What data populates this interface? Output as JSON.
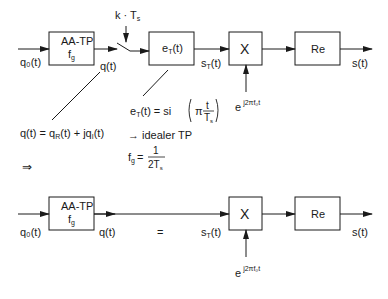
{
  "diagram": {
    "top": {
      "input_label": "q₀(t)",
      "aa_box": {
        "line1": "AA-TP",
        "line2": "f",
        "line2_sub": "g"
      },
      "q_label": "q(t)",
      "sampler_label": "k · T",
      "sampler_sub": "s",
      "eT_box": {
        "main": "e",
        "sub": "T",
        "tail": "(t)"
      },
      "sT_label": {
        "main": "s",
        "sub": "T",
        "tail": "(t)"
      },
      "mult_box": "X",
      "re_box": "Re",
      "output_label": "s(t)",
      "carrier": {
        "base": "e",
        "exp": "j2πf₀t"
      }
    },
    "annotations": {
      "q_decomp": "q(t) = q",
      "q_decomp_R": "R",
      "q_decomp_mid": "(t) + jq",
      "q_decomp_I": "I",
      "q_decomp_end": "(t)",
      "eT_def_lhs": "e",
      "eT_def_sub": "T",
      "eT_def_mid": "(t) = si",
      "eT_def_pi": "π",
      "eT_def_num": "t",
      "eT_def_den": "T",
      "eT_def_den_sub": "s",
      "ideal_tp": "→ idealer TP",
      "fg_lhs": "f",
      "fg_sub": "g",
      "fg_eq": "=",
      "fg_num": "1",
      "fg_den": "2T",
      "fg_den_sub": "s",
      "implies": "⇒"
    },
    "bottom": {
      "input_label": "q₀(t)",
      "aa_box": {
        "line1": "AA-TP",
        "line2": "f",
        "line2_sub": "g"
      },
      "q_label": "q(t)",
      "equals": "=",
      "sT_label": {
        "main": "s",
        "sub": "T",
        "tail": "(t)"
      },
      "mult_box": "X",
      "re_box": "Re",
      "output_label": "s(t)",
      "carrier": {
        "base": "e",
        "exp": "j2πf₀t"
      }
    }
  }
}
